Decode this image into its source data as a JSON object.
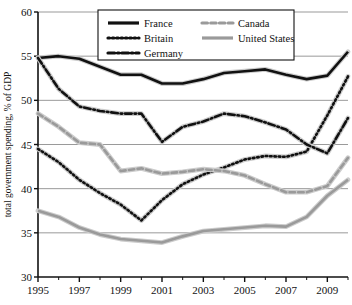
{
  "chart_data": {
    "type": "line",
    "title": "",
    "xlabel": "",
    "ylabel": "total government spending, % of GDP",
    "xlim": [
      1995,
      2010
    ],
    "ylim": [
      30,
      60
    ],
    "grid": true,
    "legend_position": "top-center",
    "x": [
      1995,
      1996,
      1997,
      1998,
      1999,
      2000,
      2001,
      2002,
      2003,
      2004,
      2005,
      2006,
      2007,
      2008,
      2009,
      2010
    ],
    "xticks": [
      1995,
      1997,
      1999,
      2001,
      2003,
      2005,
      2007,
      2009
    ],
    "xtick_labels": [
      "1995",
      "1997",
      "1999",
      "2001",
      "2003",
      "2005",
      "2007",
      "2009"
    ],
    "yticks": [
      30,
      35,
      40,
      45,
      50,
      55,
      60
    ],
    "ytick_labels": [
      "30",
      "35",
      "40",
      "45",
      "50",
      "55",
      "60"
    ],
    "series": [
      {
        "name": "France",
        "style": "solid",
        "color": "#111111",
        "width": 2.6,
        "values": [
          54.8,
          55.0,
          54.7,
          53.8,
          52.9,
          52.9,
          51.9,
          51.9,
          52.4,
          53.1,
          53.3,
          53.5,
          52.9,
          52.4,
          52.8,
          55.5
        ]
      },
      {
        "name": "Britain",
        "style": "dotted",
        "color": "#111111",
        "width": 2.6,
        "values": [
          44.5,
          43.0,
          41.0,
          39.5,
          38.2,
          36.4,
          38.7,
          40.5,
          41.6,
          42.4,
          43.3,
          43.7,
          43.6,
          44.2,
          48.3,
          52.7
        ]
      },
      {
        "name": "Germany",
        "style": "dashdot",
        "color": "#111111",
        "width": 2.6,
        "values": [
          54.8,
          51.3,
          49.3,
          48.8,
          48.5,
          48.5,
          45.3,
          47.0,
          47.6,
          48.5,
          48.2,
          47.5,
          46.7,
          45.0,
          44.0,
          48.0
        ]
      },
      {
        "name": "Canada",
        "style": "dashed",
        "color": "#9a9a9a",
        "width": 2.6,
        "values": [
          48.5,
          47.0,
          45.2,
          45.0,
          42.0,
          42.3,
          41.7,
          41.9,
          42.2,
          42.0,
          41.5,
          40.5,
          39.6,
          39.6,
          40.3,
          43.5
        ]
      },
      {
        "name": "United States",
        "style": "solid",
        "color": "#9a9a9a",
        "width": 2.6,
        "values": [
          37.5,
          36.8,
          35.6,
          34.8,
          34.3,
          34.1,
          33.9,
          34.6,
          35.2,
          35.4,
          35.6,
          35.8,
          35.7,
          36.8,
          39.2,
          41.0
        ]
      }
    ]
  },
  "legend": {
    "entries": [
      {
        "label": "France"
      },
      {
        "label": "Britain"
      },
      {
        "label": "Germany"
      },
      {
        "label": "Canada"
      },
      {
        "label": "United States"
      }
    ]
  }
}
